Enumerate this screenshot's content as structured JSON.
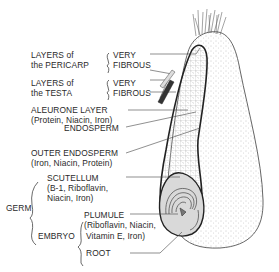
{
  "diagram": {
    "labels": {
      "pericarp": {
        "line1": "LAYERS of",
        "line2": "the PERICARP",
        "note1": "VERY",
        "note2": "FIBROUS"
      },
      "testa": {
        "line1": "LAYERS of",
        "line2": "the TESTA",
        "note1": "VERY",
        "note2": "FIBROUS"
      },
      "aleurone": {
        "line1": "ALEURONE LAYER",
        "line2": "(Protein, Niacin, Iron)"
      },
      "endosperm": {
        "line1": "ENDOSPERM"
      },
      "outer_endosperm": {
        "line1": "OUTER ENDOSPERM",
        "line2": "(Iron, Niacin, Protein)"
      },
      "germ": {
        "label": "GERM"
      },
      "scutellum": {
        "line1": "SCUTELLUM",
        "line2": "(B-1, Riboflavin,",
        "line3": "Niacin, Iron)"
      },
      "embryo": {
        "label": "EMBRYO"
      },
      "plumule": {
        "line1": "PLUMULE",
        "line2": "(Riboflavin, Niacin,",
        "line3": "Vitamin E,  Iron)"
      },
      "root": {
        "line1": "ROOT"
      }
    },
    "colors": {
      "ink": "#2a2a2a",
      "stipple": "#9a9a9a",
      "germ_fill": "#d9d9d9",
      "background": "#ffffff"
    }
  }
}
